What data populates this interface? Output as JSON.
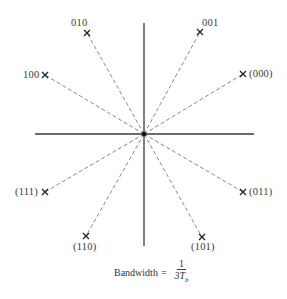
{
  "diagram": {
    "type": "signal-constellation",
    "center": {
      "x": 144,
      "y": 134
    },
    "axes": {
      "horizontal": {
        "x1": 35,
        "x2": 254,
        "y": 134
      },
      "vertical": {
        "x": 144,
        "y1": 23,
        "y2": 246
      }
    },
    "points": [
      {
        "label": "010",
        "x": 87,
        "y": 33
      },
      {
        "label": "001",
        "x": 200,
        "y": 32
      },
      {
        "label": "100",
        "x": 45,
        "y": 75
      },
      {
        "label": "(000)",
        "x": 243,
        "y": 74
      },
      {
        "label": "(111)",
        "x": 45,
        "y": 192
      },
      {
        "label": "(011)",
        "x": 243,
        "y": 192
      },
      {
        "label": "(110)",
        "x": 86,
        "y": 236
      },
      {
        "label": "(101)",
        "x": 202,
        "y": 237
      }
    ],
    "caption": {
      "text": "Bandwidth",
      "equals": "=",
      "numerator": "1",
      "denominator": "3T",
      "denominator_subscript": "b"
    },
    "colors": {
      "axis": "#3a3a3a",
      "spoke": "#6a6a6a",
      "marker": "#222222",
      "text": "#333333"
    }
  }
}
